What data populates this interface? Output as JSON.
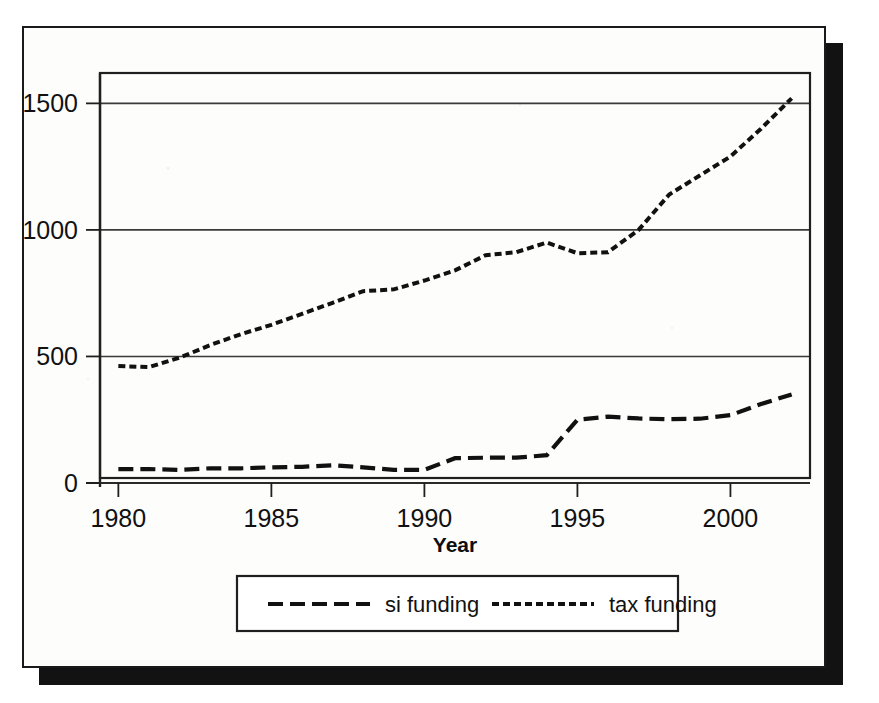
{
  "figure": {
    "background_color": "#fdfdfc",
    "border_color": "#1a1a1a",
    "shadow_color": "#121212",
    "ink_color": "#111111"
  },
  "chart_data": {
    "type": "line",
    "title": "",
    "subtitle": "",
    "xlabel": "Year",
    "ylabel": "",
    "xlim": [
      1979.4,
      2002.6
    ],
    "ylim": [
      0,
      1620
    ],
    "xticks": [
      1980,
      1985,
      1990,
      1995,
      2000
    ],
    "xtick_labels": [
      "1980",
      "1985",
      "1990",
      "1995",
      "2000"
    ],
    "yticks": [
      0,
      500,
      1000,
      1500
    ],
    "ytick_labels": [
      "0",
      "500",
      "1000",
      "1500"
    ],
    "grid": "horizontal",
    "legend_position": "below-axes",
    "x": [
      1980,
      1981,
      1982,
      1983,
      1984,
      1985,
      1986,
      1987,
      1988,
      1989,
      1990,
      1991,
      1992,
      1993,
      1994,
      1995,
      1996,
      1997,
      1998,
      1999,
      2000,
      2001,
      2002
    ],
    "series": [
      {
        "name": "si funding",
        "label": "si funding",
        "dash": "long-dash",
        "color": "#111111",
        "values": [
          55,
          55,
          52,
          58,
          58,
          62,
          64,
          70,
          62,
          52,
          52,
          98,
          100,
          100,
          110,
          250,
          262,
          255,
          252,
          254,
          268,
          312,
          350
        ]
      },
      {
        "name": "tax funding",
        "label": "tax funding",
        "dash": "short-dash",
        "color": "#111111",
        "values": [
          462,
          458,
          495,
          545,
          588,
          625,
          668,
          712,
          758,
          765,
          800,
          840,
          900,
          912,
          950,
          908,
          912,
          1000,
          1140,
          1215,
          1290,
          1400,
          1520
        ]
      }
    ]
  },
  "legend": {
    "entries": [
      {
        "label": "si funding"
      },
      {
        "label": "tax funding"
      }
    ]
  },
  "axis": {
    "x_title": "Year"
  }
}
